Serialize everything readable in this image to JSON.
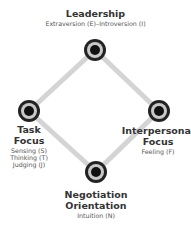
{
  "diagram": {
    "edge_color": "#d4d4d4",
    "node_colors": {
      "outer": "#222222",
      "ring": "#c8c8c8",
      "core": "#111111"
    },
    "nodes": [
      {
        "id": "leadership",
        "title": [
          "Leadership"
        ],
        "subs": [
          "Extraversion (E)–Introversion (I)"
        ]
      },
      {
        "id": "task-focus",
        "title": [
          "Task",
          "Focus"
        ],
        "subs": [
          "Sensing (S)",
          "Thinking (T)",
          "Judging (J)"
        ]
      },
      {
        "id": "interpersonal-focus",
        "title": [
          "Interpersonal",
          "Focus"
        ],
        "subs": [
          "Feeling (F)"
        ]
      },
      {
        "id": "negotiation-orientation",
        "title": [
          "Negotiation",
          "Orientation"
        ],
        "subs": [
          "Intuition (N)"
        ]
      }
    ]
  }
}
